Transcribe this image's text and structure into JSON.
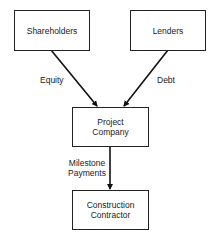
{
  "diagram": {
    "nodes": [
      {
        "id": "shareholders",
        "label": "Shareholders"
      },
      {
        "id": "lenders",
        "label": "Lenders"
      },
      {
        "id": "project_company",
        "label_line1": "Project",
        "label_line2": "Company"
      },
      {
        "id": "construction_contractor",
        "label_line1": "Construction",
        "label_line2": "Contractor"
      }
    ],
    "edges": [
      {
        "from": "shareholders",
        "to": "project_company",
        "label": "Equity"
      },
      {
        "from": "lenders",
        "to": "project_company",
        "label": "Debt"
      },
      {
        "from": "project_company",
        "to": "construction_contractor",
        "label_line1": "Milestone",
        "label_line2": "Payments"
      }
    ]
  }
}
